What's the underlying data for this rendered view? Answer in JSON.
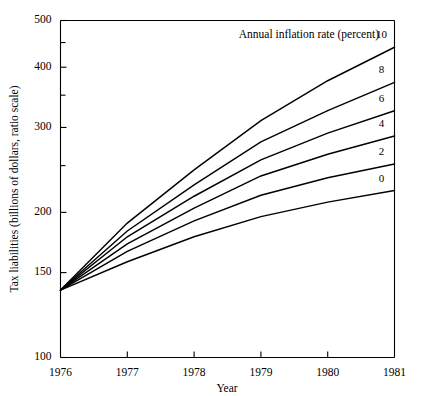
{
  "chart_data": {
    "type": "line",
    "title": "",
    "xlabel": "Year",
    "ylabel": "Tax liabilities (billions of dollars, ratio scale)",
    "annotation": "Annual inflation rate (percent)",
    "scale": "log",
    "grid": false,
    "legend_position": "right-inline",
    "x": [
      1976,
      1977,
      1978,
      1979,
      1980,
      1981
    ],
    "xlim": [
      1976,
      1981
    ],
    "ylim": [
      100,
      500
    ],
    "x_ticks": [
      "1976",
      "1977",
      "1978",
      "1979",
      "1980",
      "1981"
    ],
    "y_ticks": [
      "100",
      "150",
      "200",
      "300",
      "400",
      "500"
    ],
    "y_minor_ticks": [
      250,
      350,
      450
    ],
    "series": [
      {
        "name": "10",
        "label": "10",
        "values": [
          138,
          190,
          245,
          310,
          375,
          440
        ]
      },
      {
        "name": "8",
        "label": "8",
        "values": [
          138,
          183,
          228,
          280,
          325,
          372
        ]
      },
      {
        "name": "6",
        "label": "6",
        "values": [
          138,
          178,
          216,
          257,
          292,
          325
        ]
      },
      {
        "name": "4",
        "label": "4",
        "values": [
          138,
          172,
          204,
          238,
          264,
          288
        ]
      },
      {
        "name": "2",
        "label": "2",
        "values": [
          138,
          166,
          192,
          217,
          236,
          252
        ]
      },
      {
        "name": "0",
        "label": "0",
        "values": [
          138,
          158,
          178,
          196,
          210,
          222
        ]
      }
    ]
  },
  "axes": {
    "y_title": "Tax liabilities (billions of dollars, ratio scale)",
    "x_title": "Year"
  },
  "annotation": {
    "text": "Annual inflation rate (percent)"
  },
  "colors": {
    "line": "#000000",
    "axis": "#000000",
    "background": "#ffffff"
  }
}
